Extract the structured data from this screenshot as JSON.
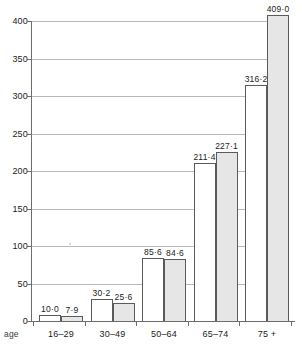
{
  "chart_data": {
    "type": "bar",
    "title": "",
    "xlabel": "age",
    "ylabel": "",
    "ylim": [
      0,
      400
    ],
    "yticks": [
      0,
      50,
      100,
      150,
      200,
      250,
      300,
      350,
      400
    ],
    "ytick_labels": [
      "0",
      "50",
      "100",
      "150",
      "200",
      "250",
      "300",
      "350",
      "400"
    ],
    "grid": true,
    "legend": "none",
    "categories": [
      "16–29",
      "30–49",
      "50–64",
      "65–74",
      "75 +"
    ],
    "series": [
      {
        "name": "series-1",
        "style": "white",
        "values": [
          10.0,
          30.2,
          85.6,
          211.4,
          316.2
        ],
        "labels": [
          "10·0",
          "30·2",
          "85·6",
          "211·4",
          "316·2"
        ]
      },
      {
        "name": "series-2",
        "style": "grey",
        "values": [
          7.9,
          25.6,
          84.6,
          227.1,
          409.0
        ],
        "labels": [
          "7·9",
          "25·6",
          "84·6",
          "227·1",
          "409·0"
        ]
      }
    ],
    "colors": {
      "series_1_fill": "#ffffff",
      "series_2_fill": "#e6e6e6",
      "bar_stroke": "#5a5a5a",
      "axis": "#6d6d6d",
      "gridline": "#b9b9b9",
      "text": "#1b1b1b",
      "background": "#ffffff"
    }
  }
}
